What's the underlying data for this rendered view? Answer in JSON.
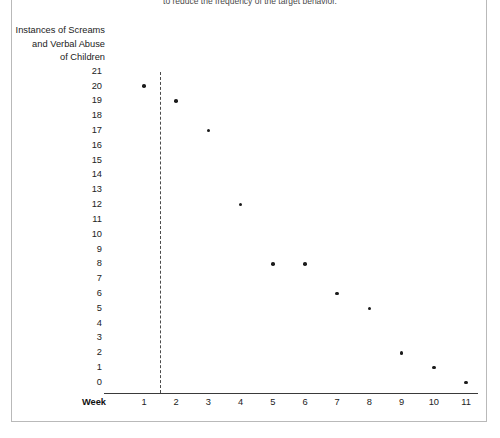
{
  "caption": {
    "fragment": "to reduce the frequency of the target behavior."
  },
  "chart_data": {
    "type": "scatter",
    "title": "",
    "subtitle": "",
    "xlabel": "Week",
    "ylabel": "Instances of Screams and Verbal Abuse of Children",
    "ylabel_lines": [
      "Instances of Screams",
      "and Verbal Abuse",
      "of Children"
    ],
    "x": [
      1,
      2,
      3,
      4,
      5,
      6,
      7,
      8,
      9,
      10,
      11
    ],
    "values": [
      20,
      19,
      17,
      12,
      8,
      8,
      6,
      5,
      2,
      1,
      0
    ],
    "categories": [
      "1",
      "2",
      "3",
      "4",
      "5",
      "6",
      "7",
      "8",
      "9",
      "10",
      "11"
    ],
    "xtick_labels": [
      "1",
      "2",
      "3",
      "4",
      "5",
      "6",
      "7",
      "8",
      "9",
      "10",
      "11"
    ],
    "ytick_labels": [
      "21",
      "20",
      "19",
      "18",
      "17",
      "16",
      "15",
      "14",
      "13",
      "12",
      "11",
      "10",
      "9",
      "8",
      "7",
      "6",
      "5",
      "4",
      "3",
      "2",
      "1",
      "0"
    ],
    "xlim": [
      0.45,
      11.6
    ],
    "ylim": [
      0,
      21
    ],
    "grid": false,
    "legend": null,
    "marker_color": "#1b1b1b",
    "axis_color": "#3a3a3a",
    "annotations": [
      {
        "name": "intervention-phase-line",
        "type": "vertical-dashed-line",
        "x": 1.5,
        "style": "dashed",
        "color": "#4a4a4a"
      }
    ]
  }
}
